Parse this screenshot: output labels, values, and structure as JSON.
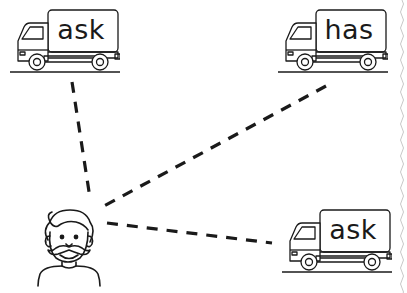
{
  "worksheet": {
    "trucks": [
      {
        "label": "ask",
        "position": "top-left"
      },
      {
        "label": "has",
        "position": "top-right"
      },
      {
        "label": "ask",
        "position": "bottom-right"
      }
    ],
    "character": {
      "name": "bearded-man",
      "icon": "man-with-mustache-icon"
    },
    "connectors": [
      {
        "from": "man",
        "to": "truck-top-left",
        "style": "dashed"
      },
      {
        "from": "man",
        "to": "truck-top-right",
        "style": "dashed"
      },
      {
        "from": "man",
        "to": "truck-bottom-right",
        "style": "dashed"
      }
    ],
    "colors": {
      "ink": "#1a1a1a",
      "background": "#ffffff",
      "edge": "#c8c8c8"
    }
  }
}
